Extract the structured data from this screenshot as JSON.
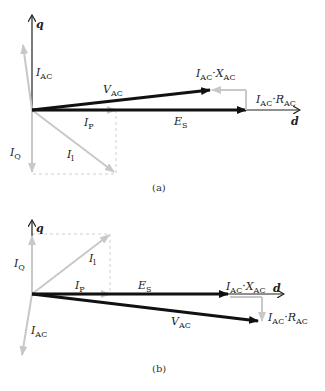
{
  "diagrams": [
    {
      "id": "a",
      "caption": "(a)",
      "axes": {
        "d": "d",
        "q": "q"
      },
      "labels": {
        "I_AC": {
          "main": "I",
          "sub": "AC"
        },
        "V_AC": {
          "main": "V",
          "sub": "AC"
        },
        "IX": {
          "main1": "I",
          "sub1": "AC",
          "dot": "·",
          "main2": "X",
          "sub2": "AC"
        },
        "IR": {
          "main1": "I",
          "sub1": "AC",
          "dot": "·",
          "main2": "R",
          "sub2": "AC"
        },
        "E_S": {
          "main": "E",
          "sub": "S"
        },
        "I_P": {
          "main": "I",
          "sub": "P"
        },
        "I_Q": {
          "main": "I",
          "sub": "Q"
        },
        "I_l": {
          "main": "I",
          "sub": "l"
        }
      }
    },
    {
      "id": "b",
      "caption": "(b)",
      "axes": {
        "d": "d",
        "q": "q"
      },
      "labels": {
        "I_AC": {
          "main": "I",
          "sub": "AC"
        },
        "V_AC": {
          "main": "V",
          "sub": "AC"
        },
        "IX": {
          "main1": "I",
          "sub1": "AC",
          "dot": "·",
          "main2": "X",
          "sub2": "AC"
        },
        "IR": {
          "main1": "I",
          "sub1": "AC",
          "dot": "·",
          "main2": "R",
          "sub2": "AC"
        },
        "E_S": {
          "main": "E",
          "sub": "S"
        },
        "I_P": {
          "main": "I",
          "sub": "P"
        },
        "I_Q": {
          "main": "I",
          "sub": "Q"
        },
        "I_l": {
          "main": "I",
          "sub": "l"
        }
      }
    }
  ],
  "colors": {
    "dark": "#111111",
    "light": "#c8c8c8",
    "dash": "#d0d0d0"
  }
}
